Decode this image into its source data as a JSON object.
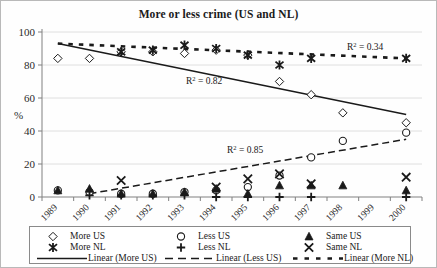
{
  "chart_data": {
    "type": "scatter",
    "title": "More or less crime (US and NL)",
    "xlabel": "",
    "ylabel": "%",
    "ylim": [
      0,
      100
    ],
    "yticks": [
      0,
      20,
      40,
      60,
      80,
      100
    ],
    "grid": true,
    "legend_position": "bottom",
    "categories": [
      "1989",
      "1990",
      "1991",
      "1992",
      "1993",
      "1994",
      "1995",
      "1996",
      "1997",
      "1998",
      "1999",
      "2000"
    ],
    "series": [
      {
        "name": "More US",
        "marker": "diamond",
        "x": [
          "1989",
          "1990",
          "1991",
          "1992",
          "1993",
          "1994",
          "1995",
          "1996",
          "1997",
          "1998",
          "2000"
        ],
        "values": [
          84,
          84,
          88,
          88,
          87,
          89,
          86,
          70,
          62,
          51,
          45
        ]
      },
      {
        "name": "Less US",
        "marker": "circle",
        "x": [
          "1989",
          "1990",
          "1991",
          "1992",
          "1993",
          "1994",
          "1995",
          "1996",
          "1997",
          "1998",
          "2000"
        ],
        "values": [
          4,
          3,
          2,
          2,
          3,
          4,
          6,
          13,
          24,
          34,
          39
        ]
      },
      {
        "name": "Same US",
        "marker": "triangle",
        "x": [
          "1989",
          "1990",
          "1991",
          "1992",
          "1993",
          "1994",
          "1995",
          "1996",
          "1997",
          "1998",
          "2000"
        ],
        "values": [
          4,
          5,
          2,
          2,
          3,
          5,
          2,
          7,
          7,
          7,
          4
        ]
      },
      {
        "name": "More NL",
        "marker": "asterisk",
        "x": [
          "1991",
          "1992",
          "1993",
          "1994",
          "1995",
          "1996",
          "1997",
          "2000"
        ],
        "values": [
          88,
          89,
          92,
          90,
          86,
          80,
          84,
          84
        ]
      },
      {
        "name": "Less NL",
        "marker": "plus",
        "x": [
          "1990",
          "1991",
          "1992",
          "1993",
          "1994",
          "1995",
          "1996",
          "1997",
          "2000"
        ],
        "values": [
          1,
          1,
          1,
          1,
          0,
          0,
          0,
          0,
          0
        ]
      },
      {
        "name": "Same NL",
        "marker": "cross",
        "x": [
          "1991",
          "1994",
          "1995",
          "1996",
          "1997",
          "2000"
        ],
        "values": [
          10,
          6,
          11,
          14,
          8,
          12
        ]
      }
    ],
    "trendlines": [
      {
        "name": "Linear (More US)",
        "style": "solid",
        "r2_label": "R2 = 0.82",
        "r2_prefix": "R",
        "r2_exp": "2",
        "r2_value": " = 0.82",
        "x0": "1989",
        "y0": 93,
        "x1": "2000",
        "y1": 50
      },
      {
        "name": "Linear (Less US)",
        "style": "dashed",
        "r2_label": "R2 = 0.85",
        "r2_prefix": "R",
        "r2_exp": "2",
        "r2_value": " = 0.85",
        "x0": "1990",
        "y0": 2,
        "x1": "2000",
        "y1": 35
      },
      {
        "name": "Linear (More NL)",
        "style": "dotted",
        "r2_label": "R2 = 0.34",
        "r2_prefix": "R",
        "r2_exp": "2",
        "r2_value": " = 0.34",
        "x0": "1989",
        "y0": 93,
        "x1": "2000",
        "y1": 84
      }
    ]
  },
  "axis": {
    "y_unit": "%",
    "yticks": [
      "100",
      "80",
      "60",
      "40",
      "20",
      "0"
    ],
    "xticks": [
      "1989",
      "1990",
      "1991",
      "1992",
      "1993",
      "1994",
      "1995",
      "1996",
      "1997",
      "1998",
      "1999",
      "2000"
    ]
  },
  "annotations": {
    "r2_more_us_prefix": "R",
    "r2_more_us_exp": "2",
    "r2_more_us_rest": " = 0.82",
    "r2_more_nl_prefix": "R",
    "r2_more_nl_exp": "2",
    "r2_more_nl_rest": " = 0.34",
    "r2_less_us_prefix": "R",
    "r2_less_us_exp": "2",
    "r2_less_us_rest": " = 0.85"
  },
  "legend": {
    "entries": [
      {
        "label": "More US",
        "marker": "diamond"
      },
      {
        "label": "Less US",
        "marker": "circle"
      },
      {
        "label": "Same US",
        "marker": "triangle"
      },
      {
        "label": "More NL",
        "marker": "asterisk"
      },
      {
        "label": "Less NL",
        "marker": "plus"
      },
      {
        "label": "Same NL",
        "marker": "cross"
      },
      {
        "label": "Linear (More US)",
        "marker": "line-solid"
      },
      {
        "label": "Linear (Less US)",
        "marker": "line-dashed"
      },
      {
        "label": "Linear (More NL)",
        "marker": "line-dotted"
      }
    ]
  },
  "colors": {
    "ink": "#1a1a1a",
    "grid": "#d8d8d8",
    "axis": "#808080",
    "frame": "#b9b9b9"
  }
}
